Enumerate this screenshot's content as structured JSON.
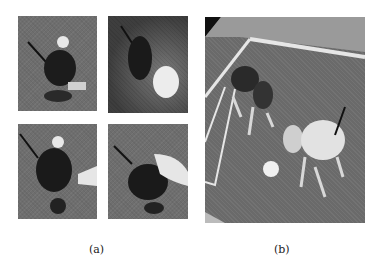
{
  "figure": {
    "panels": [
      {
        "label": "(a)",
        "subimages": [
          {
            "name": "robot-on-grass",
            "description": "quadruped robot on carpet, top view"
          },
          {
            "name": "robot-with-ball",
            "description": "robot facing a white ball"
          },
          {
            "name": "robot-with-hand-side",
            "description": "hand approaching robot from side"
          },
          {
            "name": "robot-with-hand-petting",
            "description": "hand petting robot head"
          }
        ]
      },
      {
        "label": "(b)",
        "subimages": [
          {
            "name": "robot-soccer-field",
            "description": "two robot dogs on soccer field with ball"
          }
        ]
      }
    ]
  }
}
